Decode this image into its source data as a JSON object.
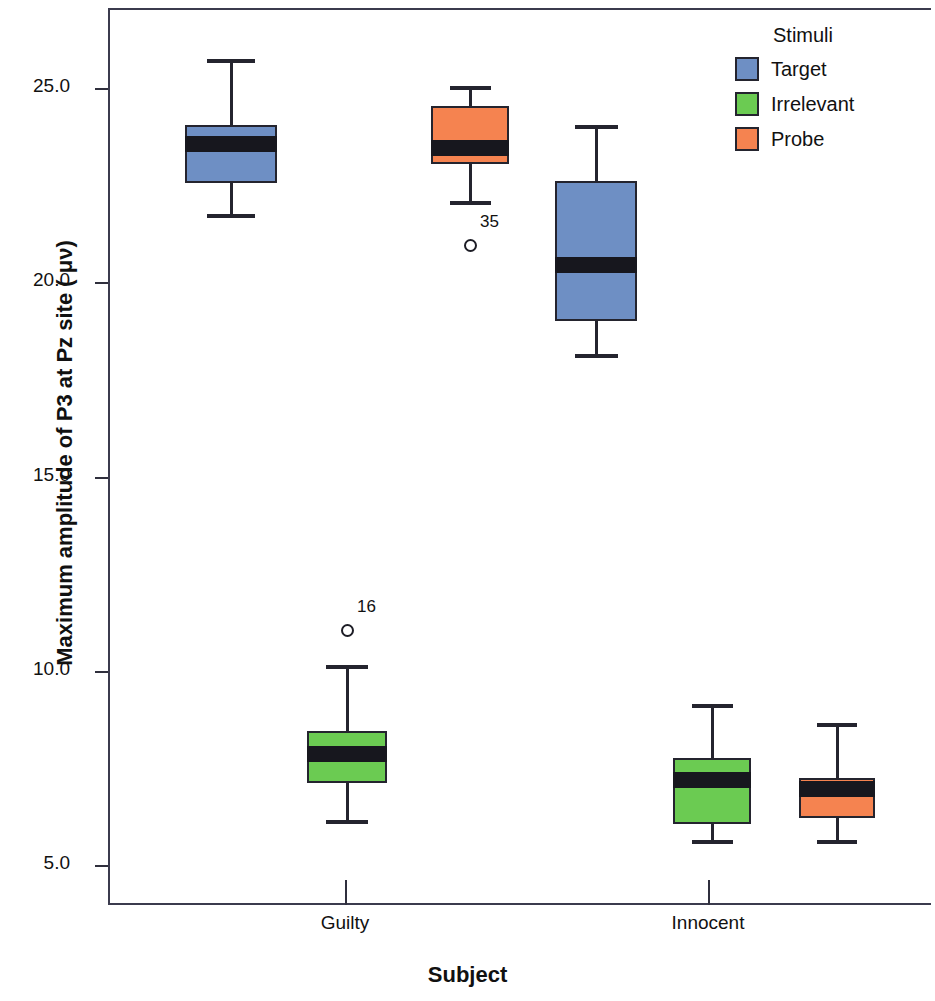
{
  "chart_data": {
    "type": "box",
    "title": "",
    "xlabel": "Subject",
    "ylabel": "Maximum amplitude of P3 at Pz site ( μν)",
    "categories": [
      "Guilty",
      "Innocent"
    ],
    "legend_title": "Stimuli",
    "legend_position": "top-right",
    "grid": false,
    "ylim": [
      3.6,
      27.1
    ],
    "yticks": [
      "25.0",
      "20.0",
      "15.0",
      "10.0",
      "5.0"
    ],
    "ytick_values": [
      25.0,
      20.0,
      15.0,
      10.0,
      5.0
    ],
    "colors": {
      "target": "#6E8FC4",
      "irrelevant": "#6BCB52",
      "probe": "#F58350",
      "outline": "#24242e",
      "axis": "#3b3b4e"
    },
    "series": [
      {
        "name": "Target",
        "color_key": "target"
      },
      {
        "name": "Irrelevant",
        "color_key": "irrelevant"
      },
      {
        "name": "Probe",
        "color_key": "probe"
      }
    ],
    "boxes": [
      {
        "group": "Guilty",
        "series": "Target",
        "color_key": "target",
        "whisker_low": 21.8,
        "q1": 22.6,
        "median": 23.6,
        "q3": 24.1,
        "whisker_high": 25.8,
        "outliers": []
      },
      {
        "group": "Guilty",
        "series": "Irrelevant",
        "color_key": "irrelevant",
        "whisker_low": 6.2,
        "q1": 7.15,
        "median": 7.9,
        "q3": 8.5,
        "whisker_high": 10.2,
        "outliers": [
          {
            "value": 11.1,
            "label": "16"
          }
        ]
      },
      {
        "group": "Guilty",
        "series": "Probe",
        "color_key": "probe",
        "whisker_low": 22.15,
        "q1": 23.1,
        "median": 23.5,
        "q3": 24.6,
        "whisker_high": 25.1,
        "outliers": [
          {
            "value": 21.0,
            "label": "35"
          }
        ]
      },
      {
        "group": "Innocent",
        "series": "Target",
        "color_key": "target",
        "whisker_low": 18.2,
        "q1": 19.05,
        "median": 20.5,
        "q3": 22.65,
        "whisker_high": 24.1,
        "outliers": []
      },
      {
        "group": "Innocent",
        "series": "Irrelevant",
        "color_key": "irrelevant",
        "whisker_low": 5.7,
        "q1": 6.1,
        "median": 7.25,
        "q3": 7.8,
        "whisker_high": 9.2,
        "outliers": []
      },
      {
        "group": "Innocent",
        "series": "Probe",
        "color_key": "probe",
        "whisker_low": 5.7,
        "q1": 6.25,
        "median": 7.0,
        "q3": 7.3,
        "whisker_high": 8.7,
        "outliers": []
      }
    ]
  },
  "legend": {
    "title": "Stimuli",
    "items": [
      {
        "label": "Target",
        "color": "#6E8FC4"
      },
      {
        "label": "Irrelevant",
        "color": "#6BCB52"
      },
      {
        "label": "Probe",
        "color": "#F58350"
      }
    ]
  },
  "axes": {
    "y_title": "Maximum amplitude of P3 at Pz site ( μν)",
    "x_title": "Subject",
    "y_ticks": [
      "25.0",
      "20.0",
      "15.0",
      "10.0",
      "5.0"
    ],
    "x_ticks": [
      "Guilty",
      "Innocent"
    ]
  }
}
